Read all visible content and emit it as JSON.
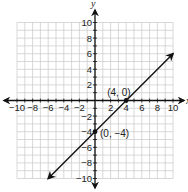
{
  "chart_data": {
    "type": "line",
    "title": "",
    "xlabel": "x",
    "ylabel": "y",
    "xlim": [
      -10,
      10
    ],
    "ylim": [
      -10,
      10
    ],
    "grid": true,
    "grid_step": 1,
    "x_ticks": [
      -10,
      -8,
      -6,
      -4,
      -2,
      2,
      4,
      6,
      8,
      10
    ],
    "y_ticks": [
      10,
      8,
      6,
      4,
      2,
      -2,
      -4,
      -6,
      -8,
      -10
    ],
    "x_tick_labels": [
      "−10",
      "−8",
      "−6",
      "−4",
      "−2",
      "2",
      "4",
      "6",
      "8",
      "10"
    ],
    "y_tick_labels": [
      "10",
      "8",
      "6",
      "4",
      "2",
      "−2",
      "−4",
      "−6",
      "−8",
      "−10"
    ],
    "series": [
      {
        "name": "y = x − 4",
        "x": [
          -6,
          10
        ],
        "y": [
          -10,
          6
        ],
        "arrows": "both"
      }
    ],
    "points": [
      {
        "x": 4,
        "y": 0,
        "label": "(4, 0)"
      },
      {
        "x": 0,
        "y": -4,
        "label": "(0, −4)"
      }
    ],
    "colors": {
      "grid": "#c8c8c8",
      "axis": "#111111",
      "line": "#111111"
    }
  }
}
